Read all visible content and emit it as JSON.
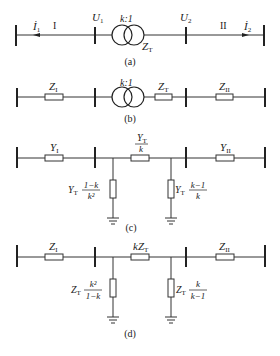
{
  "diagrams": {
    "a": {
      "caption": "(a)",
      "current_left": "İ",
      "current_left_sub": "1",
      "current_right": "İ",
      "current_right_sub": "2",
      "section_left": "I",
      "section_right": "II",
      "voltage_left": "U",
      "voltage_left_sub": "1",
      "voltage_right": "U",
      "voltage_right_sub": "2",
      "ratio": "k:1",
      "transformer_impedance": "Z",
      "transformer_impedance_sub": "T"
    },
    "b": {
      "caption": "(b)",
      "ratio": "k:1",
      "z_left": "Z",
      "z_left_sub": "I",
      "z_t": "Z",
      "z_t_sub": "T",
      "z_right": "Z",
      "z_right_sub": "II"
    },
    "c": {
      "caption": "(c)",
      "y_left": "Y",
      "y_left_sub": "I",
      "y_series_num": "Y",
      "y_series_num_sub": "T",
      "y_series_den": "k",
      "y_right": "Y",
      "y_right_sub": "II",
      "shunt_left_prefix": "Y",
      "shunt_left_prefix_sub": "T",
      "shunt_left_num": "1−k",
      "shunt_left_den": "k²",
      "shunt_right_prefix": "Y",
      "shunt_right_prefix_sub": "T",
      "shunt_right_num": "k−1",
      "shunt_right_den": "k"
    },
    "d": {
      "caption": "(d)",
      "z_left": "Z",
      "z_left_sub": "I",
      "z_series": "kZ",
      "z_series_sub": "T",
      "z_right": "Z",
      "z_right_sub": "II",
      "shunt_left_prefix": "Z",
      "shunt_left_prefix_sub": "T",
      "shunt_left_num": "k²",
      "shunt_left_den": "1−k",
      "shunt_right_prefix": "Z",
      "shunt_right_prefix_sub": "T",
      "shunt_right_num": "k",
      "shunt_right_den": "k−1"
    }
  }
}
